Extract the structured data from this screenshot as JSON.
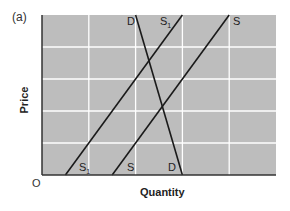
{
  "panel_label": "(a)",
  "origin_label": "O",
  "colors": {
    "background": "#bdbdbd",
    "grid": "#ffffff",
    "lines": "#1a1a1a",
    "axis": "#333333"
  },
  "chart_data": {
    "type": "line",
    "title": "(a)",
    "xlabel": "Quantity",
    "ylabel": "Price",
    "grid": true,
    "xlim": [
      0,
      5
    ],
    "ylim": [
      0,
      5
    ],
    "tick_labels_shown": false,
    "series": [
      {
        "name": "D",
        "kind": "demand",
        "points": [
          [
            2.0,
            5.0
          ],
          [
            3.0,
            0.0
          ]
        ],
        "labels": [
          "D (top)",
          "D (bottom)"
        ]
      },
      {
        "name": "S1",
        "kind": "supply",
        "points": [
          [
            0.5,
            0.0
          ],
          [
            3.0,
            5.0
          ]
        ],
        "labels": [
          "S1 (bottom)",
          "S1 (top)"
        ]
      },
      {
        "name": "S",
        "kind": "supply",
        "points": [
          [
            1.5,
            0.0
          ],
          [
            4.0,
            5.0
          ]
        ],
        "labels": [
          "S (bottom)",
          "S (top)"
        ]
      }
    ],
    "annotations": [
      "D",
      "S1",
      "S",
      "S1",
      "S",
      "D",
      "O"
    ]
  }
}
